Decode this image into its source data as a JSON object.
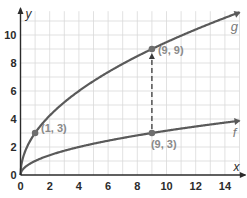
{
  "chart_data": {
    "type": "line",
    "title": "",
    "xlabel": "x",
    "ylabel": "y",
    "xlim": [
      0,
      15
    ],
    "ylim": [
      0,
      11.5
    ],
    "grid": true,
    "x_ticks": [
      "0",
      "2",
      "4",
      "6",
      "8",
      "10",
      "12",
      "14"
    ],
    "y_ticks": [
      "0",
      "2",
      "4",
      "6",
      "8",
      "10"
    ],
    "series": [
      {
        "name": "g",
        "label": "g",
        "equation": "g(x) = 3*sqrt(x)",
        "x": [
          0,
          1,
          2,
          4,
          6,
          8,
          9,
          10,
          12,
          14,
          15
        ],
        "values": [
          0,
          3,
          4.24,
          6,
          7.35,
          8.49,
          9,
          9.49,
          10.39,
          11.22,
          11.62
        ]
      },
      {
        "name": "f",
        "label": "f",
        "equation": "f(x) = sqrt(x)",
        "x": [
          0,
          1,
          2,
          4,
          6,
          8,
          9,
          10,
          12,
          14,
          15
        ],
        "values": [
          0,
          1,
          1.41,
          2,
          2.45,
          2.83,
          3,
          3.16,
          3.46,
          3.74,
          3.87
        ]
      }
    ],
    "points": [
      {
        "x": 1,
        "y": 3,
        "label": "(1, 3)",
        "series": "g"
      },
      {
        "x": 9,
        "y": 9,
        "label": "(9, 9)",
        "series": "g"
      },
      {
        "x": 9,
        "y": 3,
        "label": "(9, 3)",
        "series": "f"
      }
    ],
    "annotations": [
      {
        "type": "dashed-arrow",
        "from": [
          9,
          3
        ],
        "to": [
          9,
          9
        ],
        "description": "vertical stretch from (9, 3) to (9, 9)"
      }
    ],
    "colors": {
      "curve": "#5a5a5a",
      "grid": "#d9d9d9",
      "axis": "#2b2b2b",
      "point_label": "#8a8a8a"
    }
  }
}
